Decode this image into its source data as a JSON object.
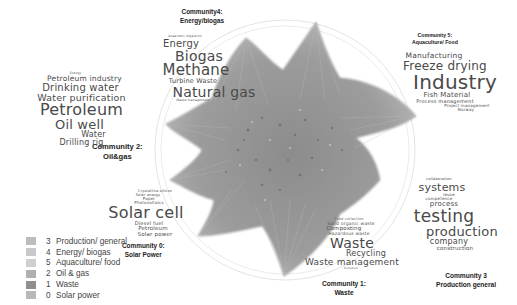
{
  "diagram": {
    "type": "network-graph-with-word-clouds"
  },
  "communities": [
    {
      "id": 4,
      "title": "Community4:",
      "subtitle": "Energy/biogas",
      "words": [
        "Anaerobic digestion",
        "Energy",
        "Biogas",
        "Methane",
        "Turbine Waste",
        "Natural gas",
        "Waste management"
      ]
    },
    {
      "id": 2,
      "title": "Community 2:",
      "subtitle": "Oil&gas",
      "words": [
        "Energy",
        "Petroleum industry",
        "Drinking water",
        "Water purification",
        "Petroleum",
        "Oil well",
        "Water",
        "Drilling rig"
      ]
    },
    {
      "id": 5,
      "title": "Community 5:",
      "subtitle": "Aquaculture/ Food",
      "words": [
        "Manufacturing",
        "Freeze drying",
        "Industry",
        "Fish Material",
        "Process management",
        "Project management",
        "Norway"
      ]
    },
    {
      "id": 0,
      "title": "Community 0:",
      "subtitle": "Solar Power",
      "words": [
        "Crystalline silicon",
        "Solar energy",
        "Paper",
        "Photovoltaics",
        "Solar cell",
        "Diesel fuel",
        "Petroleum",
        "Solar power"
      ]
    },
    {
      "id": 1,
      "title": "Community 1:",
      "subtitle": "Waste",
      "words": [
        "Food collection",
        "Solid organic waste",
        "Composting",
        "Hazardous waste",
        "Waste",
        "Recycling",
        "Waste management",
        "Pollution"
      ]
    },
    {
      "id": 3,
      "title": "Community 3",
      "subtitle": "Production general",
      "words": [
        "collaboration",
        "systems",
        "reuse",
        "competence",
        "process",
        "testing",
        "production",
        "company",
        "construction"
      ]
    }
  ],
  "legend": [
    {
      "num": "3",
      "label": "Production/ general",
      "color": "#bdbdbd"
    },
    {
      "num": "4",
      "label": "Energy/ biogas",
      "color": "#c8c8c8"
    },
    {
      "num": "5",
      "label": "Aquaculture/ food",
      "color": "#cfcfcf"
    },
    {
      "num": "2",
      "label": "Oil & gas",
      "color": "#b0b0b0"
    },
    {
      "num": "1",
      "label": "Waste",
      "color": "#8f8f8f"
    },
    {
      "num": "0",
      "label": "Solar power",
      "color": "#b8b8b8"
    }
  ],
  "colors": {
    "edges": "#8a8a8a",
    "network_fill": "#9a9a9a",
    "text": "#4a4a4a",
    "title_text": "#222222"
  }
}
